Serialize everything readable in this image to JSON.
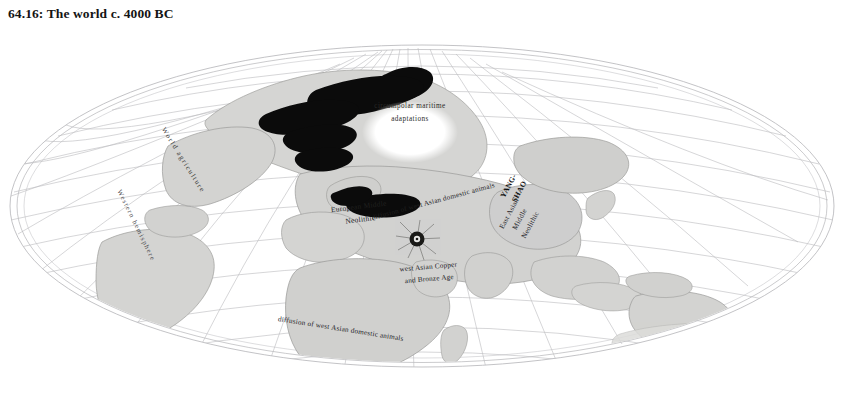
{
  "title": "64.16: The world c. 4000 BC",
  "map": {
    "projection": "oval-pseudocylindrical",
    "colors": {
      "land_fill": "#d3d3d1",
      "land_stroke": "#9a9a98",
      "graticule": "#b9b9bd",
      "outline": "#a8a8ac",
      "highlight_black": "#0a0a0a",
      "sea": "#ffffff",
      "text": "#20201f"
    },
    "labels": {
      "circumpolar": "circumpolar maritime adaptations",
      "european_neolithic": "European Middle Neolithic",
      "diffusion_north": "diffusion of west Asian domestic animals",
      "diffusion_south": "diffusion of west Asian domestic animals",
      "copper_bronze": "west Asian Copper and Bronze Age",
      "yangshao": "YANG-SHAO",
      "east_asian_neolithic": "East Asian Middle Neolithic",
      "world_agriculture": "World agriculture",
      "western_hemisphere": "Western hemisphere"
    },
    "markers": {
      "origin_point": "near-east-agriculture-origin"
    }
  }
}
